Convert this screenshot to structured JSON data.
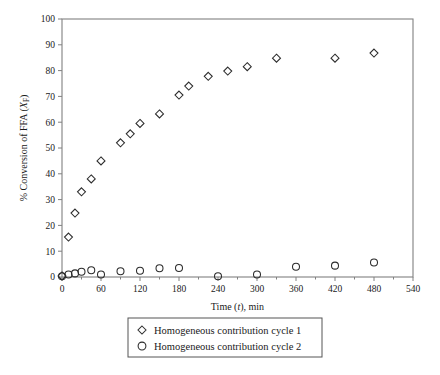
{
  "chart_data": {
    "type": "scatter",
    "title": "",
    "xlabel": "Time (t), min",
    "ylabel": "% Conversion of FFA (XF)",
    "xlim": [
      0,
      540
    ],
    "ylim": [
      0,
      100
    ],
    "xticks": [
      0,
      60,
      120,
      180,
      240,
      300,
      360,
      420,
      480,
      540
    ],
    "yticks": [
      0,
      10,
      20,
      30,
      40,
      50,
      60,
      70,
      80,
      90,
      100
    ],
    "xminor_step": 30,
    "grid": false,
    "legend_position": "below-plot",
    "series": [
      {
        "name": "Homogeneous contribution cycle 1",
        "marker": "diamond",
        "points": [
          {
            "x": 0,
            "y": 0.4
          },
          {
            "x": 10,
            "y": 15.5
          },
          {
            "x": 20,
            "y": 24.8
          },
          {
            "x": 30,
            "y": 33.0
          },
          {
            "x": 45,
            "y": 38.0
          },
          {
            "x": 60,
            "y": 45.0
          },
          {
            "x": 90,
            "y": 52.0
          },
          {
            "x": 105,
            "y": 55.5
          },
          {
            "x": 120,
            "y": 59.5
          },
          {
            "x": 150,
            "y": 63.2
          },
          {
            "x": 180,
            "y": 70.5
          },
          {
            "x": 195,
            "y": 74.0
          },
          {
            "x": 225,
            "y": 77.8
          },
          {
            "x": 255,
            "y": 79.8
          },
          {
            "x": 285,
            "y": 81.5
          },
          {
            "x": 330,
            "y": 84.8
          },
          {
            "x": 420,
            "y": 84.8
          },
          {
            "x": 480,
            "y": 86.8
          }
        ]
      },
      {
        "name": "Homogeneous contribution cycle 2",
        "marker": "circle",
        "points": [
          {
            "x": 0,
            "y": 0.3
          },
          {
            "x": 10,
            "y": 1.0
          },
          {
            "x": 20,
            "y": 1.4
          },
          {
            "x": 30,
            "y": 2.0
          },
          {
            "x": 45,
            "y": 2.6
          },
          {
            "x": 60,
            "y": 1.0
          },
          {
            "x": 90,
            "y": 2.2
          },
          {
            "x": 120,
            "y": 2.4
          },
          {
            "x": 150,
            "y": 3.4
          },
          {
            "x": 180,
            "y": 3.5
          },
          {
            "x": 240,
            "y": 0.3
          },
          {
            "x": 300,
            "y": 1.0
          },
          {
            "x": 360,
            "y": 4.0
          },
          {
            "x": 420,
            "y": 4.4
          },
          {
            "x": 480,
            "y": 5.6
          }
        ]
      }
    ]
  },
  "axes": {
    "y_label_parts": {
      "main": "% Conversion of FFA (",
      "italic": "X",
      "sub": "F",
      "close": ")"
    },
    "x_label_parts": {
      "pre": "Time (",
      "italic": "t",
      "post": "), min"
    }
  },
  "legend": {
    "entries": [
      {
        "label": "Homogeneous contribution cycle 1",
        "marker": "diamond"
      },
      {
        "label": "Homogeneous contribution cycle 2",
        "marker": "circle"
      }
    ]
  }
}
